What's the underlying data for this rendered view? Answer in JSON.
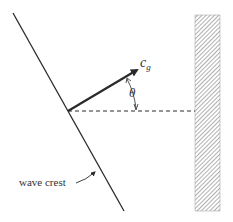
{
  "diagram": {
    "type": "wave refraction / reflection geometry",
    "labels": {
      "group_velocity": "c",
      "group_velocity_subscript": "g",
      "angle": "θ",
      "wave_crest": "wave crest"
    },
    "colors": {
      "line": "#2a2a2a",
      "hatch": "#7a7a7a",
      "text": "#333333"
    }
  }
}
